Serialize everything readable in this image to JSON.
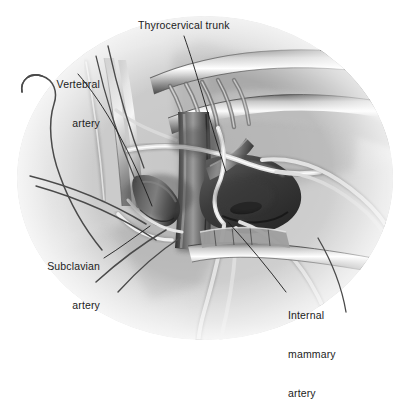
{
  "figure": {
    "kind": "grayscale medical illustration",
    "background_color": "#ffffff",
    "tissue_color": "#c9c9c9",
    "vessel_dark_color": "#3a3a3a",
    "vessel_light_color": "#d8d8d8",
    "leader_line_color": "#1b1b1b",
    "label_color": "#1b1b1b"
  },
  "labels": {
    "thyrocervical_trunk": "Thyrocervical trunk",
    "vertebral_artery_line1": "Vertebral",
    "vertebral_artery_line2": "artery",
    "subclavian_artery_line1": "Subclavian",
    "subclavian_artery_line2": "artery",
    "internal_mammary_line1": "Internal",
    "internal_mammary_line2": "mammary",
    "internal_mammary_line3": "artery"
  }
}
